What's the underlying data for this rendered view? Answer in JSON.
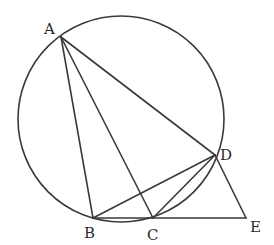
{
  "diagram": {
    "type": "geometry",
    "circle": {
      "cx": 121,
      "cy": 119,
      "r": 103
    },
    "points": {
      "A": {
        "x": 61,
        "y": 37,
        "label": "A"
      },
      "B": {
        "x": 93,
        "y": 218,
        "label": "B"
      },
      "C": {
        "x": 153,
        "y": 218,
        "label": "C"
      },
      "D": {
        "x": 215,
        "y": 155,
        "label": "D"
      },
      "E": {
        "x": 246,
        "y": 218,
        "label": "E"
      }
    },
    "segments": [
      [
        "A",
        "B"
      ],
      [
        "A",
        "C"
      ],
      [
        "A",
        "D"
      ],
      [
        "B",
        "D"
      ],
      [
        "C",
        "D"
      ],
      [
        "D",
        "E"
      ],
      [
        "B",
        "E"
      ]
    ],
    "labels": {
      "A": "A",
      "B": "B",
      "C": "C",
      "D": "D",
      "E": "E"
    },
    "stroke_color": "#3a3a3a"
  }
}
